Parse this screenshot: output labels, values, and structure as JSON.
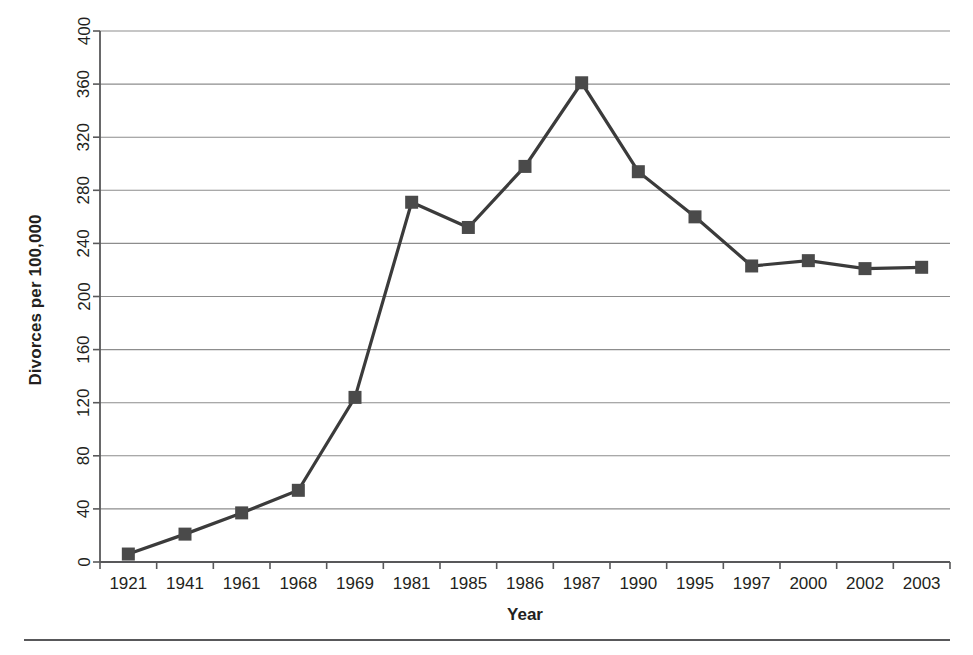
{
  "chart_data": {
    "type": "line",
    "title": "",
    "xlabel": "Year",
    "ylabel": "Divorces per 100,000",
    "categories": [
      "1921",
      "1941",
      "1961",
      "1968",
      "1969",
      "1981",
      "1985",
      "1986",
      "1987",
      "1990",
      "1995",
      "1997",
      "2000",
      "2002",
      "2003"
    ],
    "values": [
      6,
      21,
      37,
      54,
      124,
      271,
      252,
      298,
      361,
      294,
      260,
      223,
      227,
      221,
      222
    ],
    "series": [
      {
        "name": "Divorces per 100,000",
        "values": [
          6,
          21,
          37,
          54,
          124,
          271,
          252,
          298,
          361,
          294,
          260,
          223,
          227,
          221,
          222
        ]
      }
    ],
    "ylim": [
      0,
      400
    ],
    "ytick_step": 40,
    "ytick_labels": [
      "0",
      "40",
      "80",
      "120",
      "160",
      "200",
      "240",
      "280",
      "320",
      "360",
      "400"
    ],
    "grid": "horizontal",
    "legend": "none",
    "marker": "square",
    "line_color": "#3b3b3b",
    "marker_color": "#4a4a4a",
    "grid_color": "#8d8d8d",
    "axis_color": "#58585a",
    "background": "#ffffff"
  },
  "axes": {
    "y_title": "Divorces per 100,000",
    "x_title": "Year"
  },
  "footer": {
    "rule": ""
  }
}
